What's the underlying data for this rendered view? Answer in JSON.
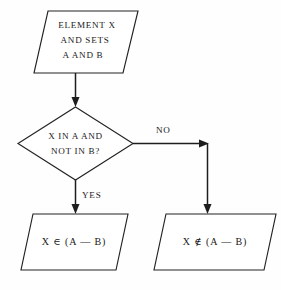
{
  "diagram": {
    "type": "flowchart",
    "background_color": "#fefefe",
    "line_color": "#1d1d1d",
    "text_color": "#191919"
  },
  "nodes": {
    "input": {
      "shape": "parallelogram",
      "role": "input",
      "lines": [
        "ELEMENT X",
        "AND SETS",
        "A AND B"
      ]
    },
    "decision": {
      "shape": "diamond",
      "role": "decision",
      "lines": [
        "X IN A AND",
        "NOT IN B?"
      ]
    },
    "output_yes": {
      "shape": "parallelogram",
      "role": "output",
      "lines": [
        "X ∈ (A — B)"
      ]
    },
    "output_no": {
      "shape": "parallelogram",
      "role": "output",
      "lines": [
        "X ∉ (A — B)"
      ]
    }
  },
  "edges": [
    {
      "id": "input-to-decision",
      "from": "input",
      "to": "decision",
      "label": ""
    },
    {
      "id": "decision-yes",
      "from": "decision",
      "to": "output_yes",
      "label": "YES"
    },
    {
      "id": "decision-no",
      "from": "decision",
      "to": "output_no",
      "label": "NO"
    }
  ]
}
